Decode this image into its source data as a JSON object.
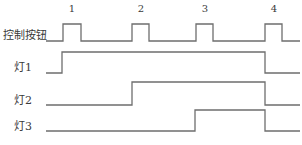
{
  "diagram": {
    "type": "timing-diagram",
    "pulse_labels": [
      "1",
      "2",
      "3",
      "4"
    ],
    "signals": [
      {
        "id": "button",
        "label": "控制按钮"
      },
      {
        "id": "lamp1",
        "label": "灯1"
      },
      {
        "id": "lamp2",
        "label": "灯2"
      },
      {
        "id": "lamp3",
        "label": "灯3"
      }
    ],
    "line_color": "#6e6e6e",
    "text_color": "#3a3a3a"
  }
}
